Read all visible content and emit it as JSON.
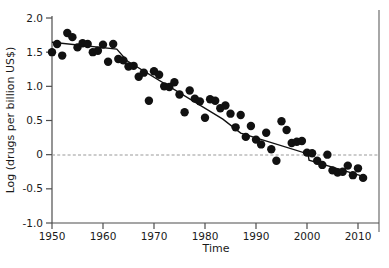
{
  "chart_data": {
    "type": "scatter",
    "title": "",
    "subtitle": "",
    "xlabel": "Time",
    "ylabel": "Log (drugs per billion US$)",
    "xlim": [
      1950,
      2012
    ],
    "ylim": [
      -1.0,
      2.0
    ],
    "xticks": [
      1950,
      1960,
      1970,
      1980,
      1990,
      2000,
      2010
    ],
    "xtick_labels": [
      "1950",
      "1960",
      "1970",
      "1980",
      "1990",
      "2000",
      "2010"
    ],
    "yticks": [
      -1.0,
      -0.5,
      0,
      0.5,
      1.0,
      1.5,
      2.0
    ],
    "ytick_labels": [
      "-1.0",
      "-0.5",
      "0",
      "0.5",
      "1.0",
      "1.5",
      "2.0"
    ],
    "grid": false,
    "legend": null,
    "annotations": [
      {
        "name": "zero-reference-line",
        "type": "hline",
        "y": 0,
        "style": "dashed",
        "color": "#9a9a9a"
      }
    ],
    "marker_color": "#111111",
    "marker_size": 4.2,
    "fit_line_color": "#111111",
    "series": [
      {
        "name": "observed",
        "type": "scatter",
        "points": [
          {
            "x": 1950,
            "y": 1.5
          },
          {
            "x": 1951,
            "y": 1.62
          },
          {
            "x": 1952,
            "y": 1.45
          },
          {
            "x": 1953,
            "y": 1.78
          },
          {
            "x": 1954,
            "y": 1.72
          },
          {
            "x": 1955,
            "y": 1.57
          },
          {
            "x": 1956,
            "y": 1.63
          },
          {
            "x": 1957,
            "y": 1.62
          },
          {
            "x": 1958,
            "y": 1.5
          },
          {
            "x": 1959,
            "y": 1.52
          },
          {
            "x": 1960,
            "y": 1.61
          },
          {
            "x": 1961,
            "y": 1.36
          },
          {
            "x": 1962,
            "y": 1.62
          },
          {
            "x": 1963,
            "y": 1.4
          },
          {
            "x": 1964,
            "y": 1.38
          },
          {
            "x": 1965,
            "y": 1.29
          },
          {
            "x": 1966,
            "y": 1.3
          },
          {
            "x": 1967,
            "y": 1.14
          },
          {
            "x": 1968,
            "y": 1.2
          },
          {
            "x": 1969,
            "y": 0.79
          },
          {
            "x": 1970,
            "y": 1.22
          },
          {
            "x": 1971,
            "y": 1.17
          },
          {
            "x": 1972,
            "y": 1.0
          },
          {
            "x": 1973,
            "y": 0.99
          },
          {
            "x": 1974,
            "y": 1.06
          },
          {
            "x": 1975,
            "y": 0.88
          },
          {
            "x": 1976,
            "y": 0.62
          },
          {
            "x": 1977,
            "y": 0.94
          },
          {
            "x": 1978,
            "y": 0.82
          },
          {
            "x": 1979,
            "y": 0.78
          },
          {
            "x": 1980,
            "y": 0.54
          },
          {
            "x": 1981,
            "y": 0.81
          },
          {
            "x": 1982,
            "y": 0.79
          },
          {
            "x": 1983,
            "y": 0.68
          },
          {
            "x": 1984,
            "y": 0.72
          },
          {
            "x": 1985,
            "y": 0.6
          },
          {
            "x": 1986,
            "y": 0.4
          },
          {
            "x": 1987,
            "y": 0.58
          },
          {
            "x": 1988,
            "y": 0.26
          },
          {
            "x": 1989,
            "y": 0.42
          },
          {
            "x": 1990,
            "y": 0.22
          },
          {
            "x": 1991,
            "y": 0.15
          },
          {
            "x": 1992,
            "y": 0.32
          },
          {
            "x": 1993,
            "y": 0.08
          },
          {
            "x": 1994,
            "y": -0.09
          },
          {
            "x": 1995,
            "y": 0.49
          },
          {
            "x": 1996,
            "y": 0.36
          },
          {
            "x": 1997,
            "y": 0.17
          },
          {
            "x": 1998,
            "y": 0.19
          },
          {
            "x": 1999,
            "y": 0.2
          },
          {
            "x": 2000,
            "y": 0.03
          },
          {
            "x": 2001,
            "y": 0.02
          },
          {
            "x": 2002,
            "y": -0.09
          },
          {
            "x": 2003,
            "y": -0.15
          },
          {
            "x": 2004,
            "y": 0.0
          },
          {
            "x": 2005,
            "y": -0.23
          },
          {
            "x": 2006,
            "y": -0.26
          },
          {
            "x": 2007,
            "y": -0.25
          },
          {
            "x": 2008,
            "y": -0.16
          },
          {
            "x": 2009,
            "y": -0.3
          },
          {
            "x": 2010,
            "y": -0.2
          },
          {
            "x": 2011,
            "y": -0.34
          }
        ]
      },
      {
        "name": "piecewise-trend-fit",
        "type": "line",
        "points": [
          {
            "x": 1950.0,
            "y": 1.645
          },
          {
            "x": 1962.7,
            "y": 1.545
          },
          {
            "x": 1964.7,
            "y": 1.375
          },
          {
            "x": 1983.5,
            "y": 0.52
          },
          {
            "x": 1987.0,
            "y": 0.315
          },
          {
            "x": 2000.2,
            "y": 0.01
          },
          {
            "x": 2000.4,
            "y": -0.08
          },
          {
            "x": 2011.5,
            "y": -0.33
          }
        ]
      }
    ]
  }
}
